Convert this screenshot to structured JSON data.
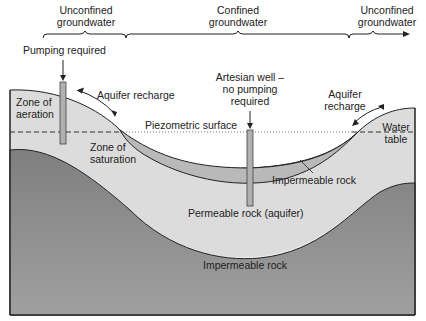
{
  "header": {
    "sections": [
      {
        "label_line1": "Unconfined",
        "label_line2": "groundwater"
      },
      {
        "label_line1": "Confined",
        "label_line2": "groundwater"
      },
      {
        "label_line1": "Unconfined",
        "label_line2": "groundwater"
      }
    ]
  },
  "labels": {
    "pumping_required": "Pumping required",
    "aquifer_recharge_left": "Aquifer recharge",
    "artesian_line1": "Artesian well –",
    "artesian_line2": "no pumping",
    "artesian_line3": "required",
    "aquifer_recharge_right_line1": "Aquifer",
    "aquifer_recharge_right_line2": "recharge",
    "zone_aeration_line1": "Zone of",
    "zone_aeration_line2": "aeration",
    "piezometric_surface": "Piezometric surface",
    "water_table_line1": "Water",
    "water_table_line2": "table",
    "zone_saturation_line1": "Zone of",
    "zone_saturation_line2": "saturation",
    "impermeable_rock_upper": "Impermeable rock",
    "permeable_rock": "Permeable rock (aquifer)",
    "impermeable_rock_lower": "Impermeable rock"
  },
  "colors": {
    "surface_layer": "#dcdcdc",
    "aquifer": "#e6e6e6",
    "confining_layer": "#b8b8b8",
    "bedrock": "#8f8f8f",
    "well": "#b0b0b0",
    "line": "#222222"
  }
}
